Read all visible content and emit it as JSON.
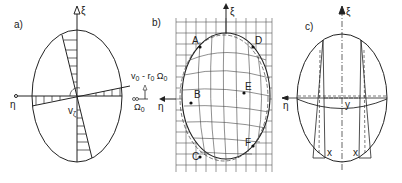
{
  "panels": {
    "a": {
      "label": "a)",
      "xi": "ξ",
      "eta": "η",
      "v_zeta": "v",
      "v_zeta_sub": "ζ"
    },
    "b": {
      "label": "b)",
      "xi": "ξ",
      "eta": "η",
      "points": [
        {
          "name": "A",
          "x": 197,
          "y": 41
        },
        {
          "name": "D",
          "x": 252,
          "y": 45
        },
        {
          "name": "B",
          "x": 192,
          "y": 102
        },
        {
          "name": "E",
          "x": 244,
          "y": 93
        },
        {
          "name": "C",
          "x": 200,
          "y": 155
        },
        {
          "name": "F",
          "x": 252,
          "y": 145
        }
      ],
      "v_label": "v",
      "v_sub": "0",
      "minus": " - r",
      "r_sub": "0",
      "omega": " Ω",
      "omega_sub": "0",
      "omega0": "Ω",
      "omega0_sub": "0"
    },
    "c": {
      "label": "c)",
      "xi": "ξ",
      "eta": "η",
      "x_left": "x",
      "x_right": "x",
      "y_label": "y"
    }
  },
  "colors": {
    "stroke": "#222222",
    "grid": "#555555",
    "background": "#ffffff"
  }
}
